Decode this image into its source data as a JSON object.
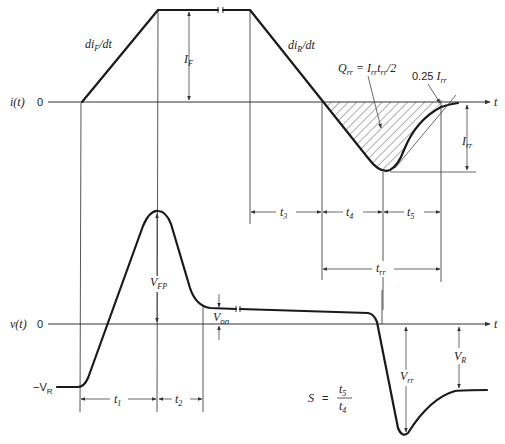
{
  "diagram": {
    "current_plot": {
      "y_label": "i(t)",
      "zero_label": "0",
      "x_axis_label": "t",
      "rise_slope_label": "di",
      "rise_slope_sub": "F",
      "rise_slope_tail": "/dt",
      "fall_slope_label": "di",
      "fall_slope_sub": "R",
      "fall_slope_tail": "/dt",
      "forward_current_label": "I",
      "forward_current_sub": "F",
      "charge_label": "Q",
      "charge_sub": "rr",
      "charge_eq": " = I",
      "charge_eq_sub1": "rr",
      "charge_eq_t": "t",
      "charge_eq_sub2": "rr",
      "charge_eq_tail": "/2",
      "quarter_label_num": "0.25 ",
      "quarter_label_I": "I",
      "quarter_label_sub": "rr",
      "peak_reverse_label": "I",
      "peak_reverse_sub": "rr"
    },
    "time_intervals": {
      "t3": {
        "main": "t",
        "sub": "3"
      },
      "t4": {
        "main": "t",
        "sub": "4"
      },
      "t5": {
        "main": "t",
        "sub": "5"
      },
      "trr": {
        "main": "t",
        "sub": "rr"
      },
      "t1": {
        "main": "t",
        "sub": "1"
      },
      "t2": {
        "main": "t",
        "sub": "2"
      }
    },
    "voltage_plot": {
      "y_label": "v(t)",
      "zero_label": "0",
      "x_axis_label": "t",
      "neg_vr_label": "−V",
      "neg_vr_sub": "R",
      "vfp_label": "V",
      "vfp_sub": "FP",
      "von_label": "V",
      "von_sub": "on",
      "vrr_label": "V",
      "vrr_sub": "rr",
      "vr_label": "V",
      "vr_sub": "R"
    },
    "softness": {
      "lhs": "S",
      "eq": "=",
      "num_main": "t",
      "num_sub": "5",
      "den_main": "t",
      "den_sub": "4"
    }
  }
}
